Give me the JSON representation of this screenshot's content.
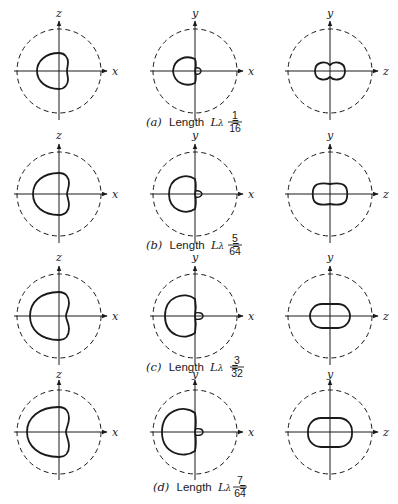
{
  "figure": {
    "rows": [
      {
        "id": "a",
        "caption_letter": "(a)",
        "caption_text": "Length",
        "caption_symbol": "L",
        "caption_subscript": "λ",
        "caption_equals": "=",
        "numerator": "1",
        "denominator": "16",
        "length_fraction": "1/16"
      },
      {
        "id": "b",
        "caption_letter": "(b)",
        "caption_text": "Length",
        "caption_symbol": "L",
        "caption_subscript": "λ",
        "caption_equals": "=",
        "numerator": "5",
        "denominator": "64",
        "length_fraction": "5/64"
      },
      {
        "id": "c",
        "caption_letter": "(c)",
        "caption_text": "Length",
        "caption_symbol": "L",
        "caption_subscript": "λ",
        "caption_equals": "=",
        "numerator": "3",
        "denominator": "32",
        "length_fraction": "3/32"
      },
      {
        "id": "d",
        "caption_letter": "(d)",
        "caption_text": "Length",
        "caption_symbol": "L",
        "caption_subscript": "λ",
        "caption_equals": "=",
        "numerator": "7",
        "denominator": "64",
        "length_fraction": "7/64"
      }
    ],
    "columns": [
      {
        "plane": "xz",
        "vertical_axis": "z",
        "horizontal_axis": "x"
      },
      {
        "plane": "xy",
        "vertical_axis": "y",
        "horizontal_axis": "x"
      },
      {
        "plane": "yz",
        "vertical_axis": "y",
        "horizontal_axis": "z"
      }
    ],
    "legend": {
      "dashed_circle": "reference circle",
      "solid_curve": "field pattern"
    },
    "colors": {
      "ink": "#1a1a1a",
      "background": "#ffffff"
    }
  }
}
